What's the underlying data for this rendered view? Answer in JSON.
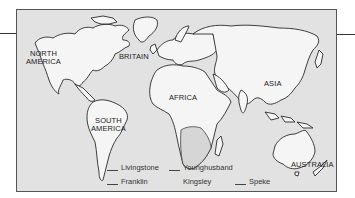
{
  "map": {
    "title": "World map of explorer routes",
    "colors": {
      "ocean": "#e2e2e2",
      "land": "#f5f5f5",
      "outline": "#2a2a2a"
    },
    "regions": [
      {
        "id": "north-america",
        "label": "NORTH\nAMERICA",
        "line1": "NORTH",
        "line2": "AMERICA"
      },
      {
        "id": "britain",
        "label": "BRITAIN"
      },
      {
        "id": "africa",
        "label": "AFRICA"
      },
      {
        "id": "asia",
        "label": "ASIA"
      },
      {
        "id": "south-america",
        "label": "SOUTH\nAMERICA",
        "line1": "SOUTH",
        "line2": "AMERICA"
      },
      {
        "id": "australia",
        "label": "AUSTRALIA"
      }
    ]
  },
  "legend": {
    "items": [
      {
        "name": "Livingstone",
        "line_style": "solid"
      },
      {
        "name": "Younghusband",
        "line_style": "solid"
      },
      {
        "name": "Franklin",
        "line_style": "solid"
      },
      {
        "name": "Kingsley",
        "line_style": "none"
      },
      {
        "name": "Speke",
        "line_style": "solid"
      }
    ]
  }
}
